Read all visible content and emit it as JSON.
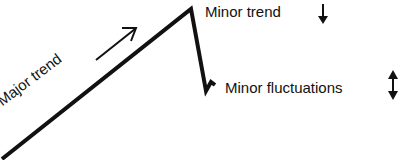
{
  "diagram": {
    "labels": {
      "major_trend": "Major trend",
      "minor_trend": "Minor trend",
      "minor_fluctuations": "Minor fluctuations"
    },
    "icons": {
      "major_trend": "arrow-up-right",
      "minor_trend": "arrow-down",
      "minor_fluctuations": "arrow-up-down"
    },
    "line_color": "#111111"
  }
}
